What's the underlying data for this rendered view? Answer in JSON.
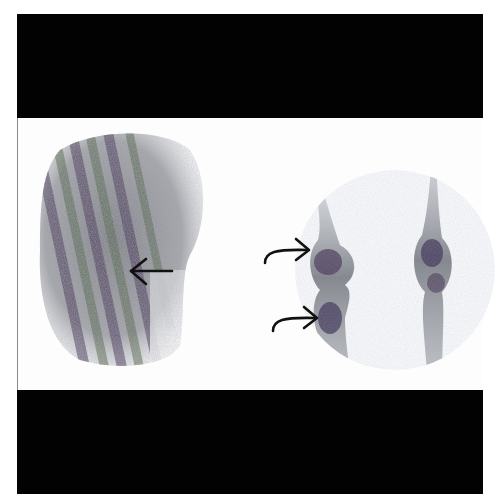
{
  "figure": {
    "type": "bone scintigraphy (planar nuclear medicine scan)",
    "layout": "single panel between black top and bottom bands",
    "colors": {
      "band": "#020202",
      "background": "#fdfdfd",
      "uptake_dark": "#4a3a5a",
      "uptake_mid": "#7b7f86",
      "uptake_green": "#5a6b52",
      "arrow": "#111111",
      "border": "#8a8a8a"
    },
    "left_view": {
      "label": "",
      "description": "large oval region of heterogeneous tracer uptake with diagonal dark streaks",
      "annotation": {
        "type": "straight-arrow",
        "direction": "left"
      }
    },
    "right_view": {
      "label": "",
      "description": "two limb bone structures with focal uptake near joints",
      "annotations": [
        {
          "type": "curved-arrow",
          "direction": "right",
          "target": "upper focal uptake, left limb"
        },
        {
          "type": "curved-arrow",
          "direction": "right",
          "target": "lower focal uptake, left limb"
        }
      ]
    }
  }
}
